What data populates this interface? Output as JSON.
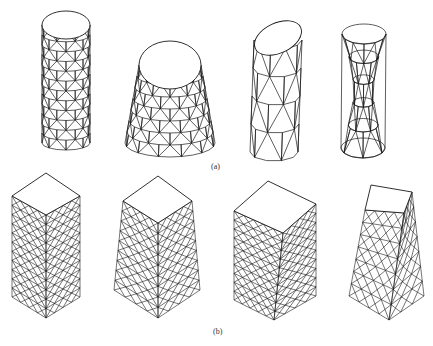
{
  "figure": {
    "row_a": {
      "label": "(a)",
      "shapes": [
        "cylinder",
        "truncated-cone",
        "tilted-cylinder",
        "hyperboloid"
      ]
    },
    "row_b": {
      "label": "(b)",
      "shapes": [
        "square-prism",
        "tapered-square-prism",
        "rectangular-prism",
        "tapered-wedge-prism"
      ]
    },
    "colors": {
      "line": "#1a1a1a",
      "background": "#ffffff"
    }
  }
}
